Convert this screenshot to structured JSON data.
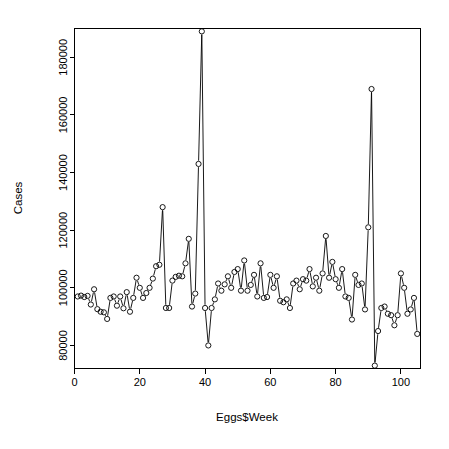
{
  "chart_data": {
    "type": "scatter",
    "plot_style": "points-and-lines",
    "title": "",
    "subtitle": "",
    "xlabel": "Eggs$Week",
    "ylabel": "Cases",
    "xlim": [
      0,
      106
    ],
    "ylim": [
      72000,
      190000
    ],
    "grid": false,
    "legend": null,
    "legend_position": "none",
    "marker": "open-circle",
    "marker_color": "#000000",
    "line_color": "#000000",
    "xticks": [
      0,
      20,
      40,
      60,
      80,
      100
    ],
    "xtick_labels": [
      "0",
      "20",
      "40",
      "60",
      "80",
      "100"
    ],
    "yticks": [
      80000,
      100000,
      120000,
      140000,
      160000,
      180000
    ],
    "ytick_labels": [
      "80000",
      "100000",
      "120000",
      "140000",
      "160000",
      "180000"
    ],
    "x": [
      1,
      2,
      3,
      4,
      5,
      6,
      7,
      8,
      9,
      10,
      11,
      12,
      13,
      14,
      15,
      16,
      17,
      18,
      19,
      20,
      21,
      22,
      23,
      24,
      25,
      26,
      27,
      28,
      29,
      30,
      31,
      32,
      33,
      34,
      35,
      36,
      37,
      38,
      39,
      40,
      41,
      42,
      43,
      44,
      45,
      46,
      47,
      48,
      49,
      50,
      51,
      52,
      53,
      54,
      55,
      56,
      57,
      58,
      59,
      60,
      61,
      62,
      63,
      64,
      65,
      66,
      67,
      68,
      69,
      70,
      71,
      72,
      73,
      74,
      75,
      76,
      77,
      78,
      79,
      80,
      81,
      82,
      83,
      84,
      85,
      86,
      87,
      88,
      89,
      90,
      91,
      92,
      93,
      94,
      95,
      96,
      97,
      98,
      99,
      100,
      101,
      102,
      103,
      104,
      105
    ],
    "y": [
      97000,
      97300,
      96800,
      97200,
      94200,
      99500,
      92600,
      91700,
      91500,
      89200,
      96500,
      97000,
      93800,
      97000,
      92900,
      98500,
      91700,
      96500,
      103500,
      100000,
      96500,
      98200,
      100000,
      103200,
      107500,
      108000,
      128000,
      93000,
      93000,
      102500,
      103800,
      104200,
      104000,
      108500,
      117000,
      93500,
      98000,
      143000,
      189000,
      93000,
      80000,
      93000,
      96000,
      101500,
      99000,
      101200,
      104000,
      100000,
      105500,
      106500,
      99000,
      109500,
      99000,
      101000,
      104500,
      97000,
      108500,
      96500,
      96800,
      104500,
      100000,
      104000,
      95500,
      95000,
      96000,
      93000,
      101500,
      102500,
      99500,
      103000,
      102500,
      106500,
      100500,
      103500,
      99000,
      105000,
      118000,
      103500,
      109000,
      103000,
      100000,
      106500,
      97000,
      96500,
      89000,
      104500,
      101000,
      101500,
      92500,
      121000,
      169000,
      73000,
      85000,
      93000,
      93500,
      91000,
      90500,
      87000,
      90500,
      105000,
      100000,
      91000,
      92500,
      96500,
      84000
    ]
  },
  "axes": {
    "x_title": "Eggs$Week",
    "y_title": "Cases"
  }
}
